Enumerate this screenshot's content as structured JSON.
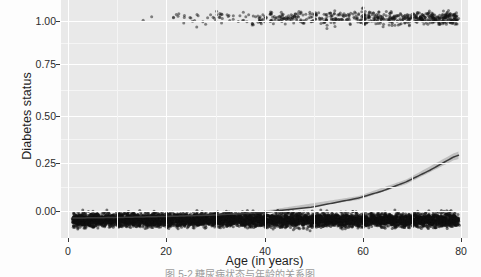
{
  "chart_data": {
    "type": "scatter",
    "title": "",
    "subtitle": "",
    "xlabel": "Age (in years)",
    "ylabel": "Diabetes status",
    "xlim": [
      -2.5,
      83
    ],
    "ylim": [
      -0.09,
      1.09
    ],
    "xticks": [
      0,
      20,
      40,
      60,
      80
    ],
    "xtick_labels": [
      "0",
      "20",
      "40",
      "60",
      "80"
    ],
    "yticks": [
      0.0,
      0.25,
      0.5,
      0.75,
      1.0
    ],
    "ytick_labels": [
      "0.00",
      "0.25",
      "0.50",
      "0.75",
      "1.00"
    ],
    "grid": true,
    "grid_major_color": "#ffffff",
    "grid_minor_color": "#f5f5f5",
    "panel_background": "#e9e9e9",
    "legend_position": "none",
    "point_color": "#111111",
    "point_shape": "circle",
    "jitter": true,
    "series": [
      {
        "name": "Diabetes status = 0 (no diabetes)",
        "jitter_level": 0.0,
        "x_range": [
          0,
          81
        ],
        "density_note": "very dense continuous jittered band across full age range",
        "n_approx": 6200
      },
      {
        "name": "Diabetes status = 1 (diabetes)",
        "jitter_level": 1.0,
        "x_range": [
          13,
          81
        ],
        "density_note": "sparse below age 45, increasingly dense from 45 to 81",
        "n_approx": 620
      }
    ],
    "fit": {
      "name": "Logistic regression fit",
      "method": "glm (binomial)",
      "line_color": "#3b3b3b",
      "band_color": "#b9b9b9",
      "points": [
        {
          "x": 0,
          "y": 0.009
        },
        {
          "x": 10,
          "y": 0.012
        },
        {
          "x": 20,
          "y": 0.017
        },
        {
          "x": 30,
          "y": 0.024
        },
        {
          "x": 40,
          "y": 0.037
        },
        {
          "x": 50,
          "y": 0.062
        },
        {
          "x": 60,
          "y": 0.108
        },
        {
          "x": 65,
          "y": 0.143
        },
        {
          "x": 70,
          "y": 0.188
        },
        {
          "x": 75,
          "y": 0.246
        },
        {
          "x": 80,
          "y": 0.312
        },
        {
          "x": 81,
          "y": 0.32
        }
      ],
      "band_upper": [
        {
          "x": 0,
          "y": 0.014
        },
        {
          "x": 20,
          "y": 0.022
        },
        {
          "x": 40,
          "y": 0.044
        },
        {
          "x": 60,
          "y": 0.118
        },
        {
          "x": 70,
          "y": 0.2
        },
        {
          "x": 80,
          "y": 0.33
        },
        {
          "x": 81,
          "y": 0.339
        }
      ],
      "band_lower": [
        {
          "x": 0,
          "y": 0.005
        },
        {
          "x": 20,
          "y": 0.013
        },
        {
          "x": 40,
          "y": 0.031
        },
        {
          "x": 60,
          "y": 0.099
        },
        {
          "x": 70,
          "y": 0.177
        },
        {
          "x": 80,
          "y": 0.295
        },
        {
          "x": 81,
          "y": 0.302
        }
      ]
    }
  },
  "caption": {
    "text": "图 5-2  糖尿病状态与年龄的关系图"
  }
}
